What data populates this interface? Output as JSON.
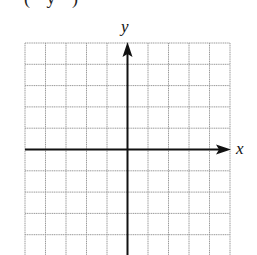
{
  "top_fragment": "(     y        )",
  "graph": {
    "x_label": "x",
    "y_label": "y",
    "grid": {
      "columns": 10,
      "rows_visible": 10,
      "line_color": "#9a9a9a",
      "axis_color": "#111111"
    }
  }
}
